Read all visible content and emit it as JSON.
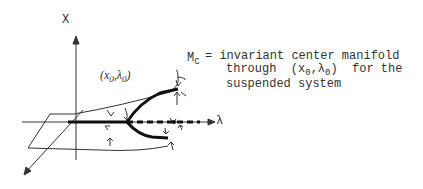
{
  "diagram": {
    "axis_x_label": "X",
    "axis_lambda_label": "λ",
    "point_label": "(x",
    "point_label_sub0": "0",
    "point_label_mid": ",λ",
    "point_label_sub1": "0",
    "point_label_end": ")",
    "manifold_symbol": "M",
    "manifold_sub": "C",
    "definition_line1": "= invariant center manifold",
    "definition_line2_a": "through  (x",
    "definition_line2_sub0": "0",
    "definition_line2_b": ",λ",
    "definition_line2_sub1": "0",
    "definition_line2_c": ")  for the",
    "definition_line3": "suspended system"
  }
}
